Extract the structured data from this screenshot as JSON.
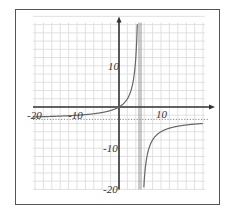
{
  "chart_data": {
    "type": "line",
    "title": "",
    "xlabel": "",
    "ylabel": "",
    "function": "f(x) = -3x / (x - 5)",
    "xlim": [
      -20,
      20
    ],
    "ylim": [
      -20,
      20
    ],
    "grid": true,
    "grid_step": 2,
    "x_tick_labels": [
      "-20",
      "-10",
      "10"
    ],
    "y_tick_labels": [
      "10",
      "-10",
      "-20"
    ],
    "vertical_asymptote": 5,
    "horizontal_asymptote": -3,
    "series": [
      {
        "name": "left-branch",
        "x": [
          -20,
          -15,
          -10,
          -5,
          -2,
          0,
          2,
          3,
          4,
          4.5
        ],
        "y": [
          -2.4,
          -2.25,
          -2.0,
          -1.5,
          -0.86,
          0,
          2,
          4.5,
          12,
          27
        ]
      },
      {
        "name": "right-branch",
        "x": [
          5.8,
          6,
          7,
          8,
          10,
          15,
          20
        ],
        "y": [
          -24.75,
          -18,
          -10.5,
          -8,
          -6,
          -4.5,
          -4
        ]
      }
    ],
    "colors": {
      "axis": "#333333",
      "grid": "#d9d9d9",
      "curve": "#666666",
      "asymptote": "#888888",
      "frame": "#555555"
    }
  }
}
